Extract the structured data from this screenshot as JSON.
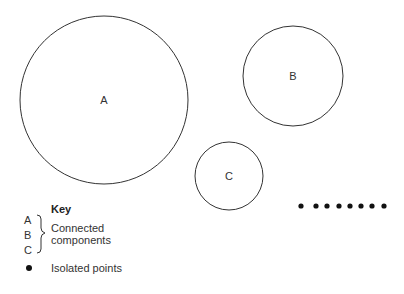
{
  "diagram": {
    "components": [
      {
        "label": "A",
        "cx": 104,
        "cy": 100,
        "r": 84
      },
      {
        "label": "B",
        "cx": 293,
        "cy": 76,
        "r": 50
      },
      {
        "label": "C",
        "cx": 229,
        "cy": 176,
        "r": 34
      }
    ],
    "isolated_points": {
      "y": 206,
      "x": [
        301,
        316,
        327,
        339,
        350,
        361,
        372,
        384
      ]
    },
    "stroke_color": "#333333",
    "point_color": "#111111"
  },
  "key": {
    "title": "Key",
    "letters": [
      "A",
      "B",
      "C"
    ],
    "connected_label_line1": "Connected",
    "connected_label_line2": "components",
    "isolated_label": "Isolated points"
  }
}
